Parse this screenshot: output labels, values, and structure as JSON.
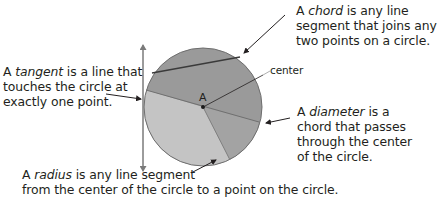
{
  "labels": {
    "chord": {
      "line1_pre": "A ",
      "term": "chord",
      "line1_post": " is any line",
      "line2": "segment that joins any",
      "line3": "two points on a circle."
    },
    "tangent": {
      "line1_pre": "A ",
      "term": "tangent",
      "line1_post": " is a line that",
      "line2": "touches the circle at",
      "line3": "exactly one point."
    },
    "center": "center",
    "point": "A",
    "diameter": {
      "line1_pre": "A ",
      "term": "diameter",
      "line1_post": " is a",
      "line2": "chord that passes",
      "line3": "through the center",
      "line4": "of the circle."
    },
    "radius": {
      "line1_pre": "A ",
      "term": "radius",
      "line1_post": " is any line segment",
      "line2": "from the center of the circle to a point on the circle."
    }
  },
  "colors": {
    "dark_region": "#9a9a9a",
    "light_region": "#c4c4c4",
    "outline": "#6e6e6e",
    "text": "#231f20",
    "arrow": "#231f20"
  }
}
